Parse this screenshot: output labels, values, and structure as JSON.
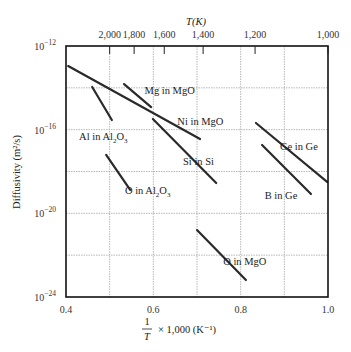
{
  "chart_data": {
    "type": "line",
    "title": "",
    "xlabel": "1/T × 1,000 (K⁻¹)",
    "ylabel": "Diffusivity (m²/s)",
    "top_xlabel": "T(K)",
    "xlim": [
      0.4,
      1.0
    ],
    "ylim_log10": [
      -24,
      -12
    ],
    "yscale": "log",
    "grid": true,
    "x_ticks": [
      0.4,
      0.6,
      0.8,
      1.0
    ],
    "x_tick_labels": [
      "0.4",
      "0.6",
      "0.8",
      "1.0"
    ],
    "x_grid": [
      0.5,
      0.6,
      0.7,
      0.8,
      0.9
    ],
    "y_ticks_log10": [
      -12,
      -16,
      -20,
      -24
    ],
    "y_tick_labels": [
      "10⁻¹²",
      "10⁻¹⁶",
      "10⁻²⁰",
      "10⁻²⁴"
    ],
    "y_grid_log10": [
      -14,
      -16,
      -18,
      -20,
      -22
    ],
    "top_ticks": [
      {
        "label": "2,000",
        "T": 2000,
        "x": 0.5
      },
      {
        "label": "1,800",
        "T": 1800,
        "x": 0.556
      },
      {
        "label": "1,600",
        "T": 1600,
        "x": 0.625
      },
      {
        "label": "1,400",
        "T": 1400,
        "x": 0.714
      },
      {
        "label": "1,200",
        "T": 1200,
        "x": 0.833
      },
      {
        "label": "1,000",
        "T": 1000,
        "x": 1.0
      }
    ],
    "series": [
      {
        "name": "Ni in MgO",
        "x": [
          0.405,
          0.707
        ],
        "log10_D": [
          -12.96,
          -16.45
        ],
        "label_pos": [
          0.655,
          -15.6
        ]
      },
      {
        "name": "Mg in MgO",
        "x": [
          0.533,
          0.595
        ],
        "log10_D": [
          -13.82,
          -14.92
        ],
        "label_pos": [
          0.58,
          -14.1
        ]
      },
      {
        "name": "Al in Al2O3",
        "x": [
          0.46,
          0.505
        ],
        "log10_D": [
          -13.96,
          -15.54
        ],
        "label_pos": [
          0.43,
          -16.3
        ]
      },
      {
        "name": "Si in Si",
        "x": [
          0.599,
          0.744
        ],
        "log10_D": [
          -15.49,
          -18.55
        ],
        "label_pos": [
          0.668,
          -17.5
        ]
      },
      {
        "name": "O in Al2O3",
        "x": [
          0.492,
          0.547
        ],
        "log10_D": [
          -17.21,
          -18.88
        ],
        "label_pos": [
          0.535,
          -18.9
        ]
      },
      {
        "name": "Ge in Ge",
        "x": [
          0.835,
          0.998
        ],
        "log10_D": [
          -15.68,
          -18.5
        ],
        "label_pos": [
          0.89,
          -16.8
        ]
      },
      {
        "name": "B in Ge",
        "x": [
          0.849,
          0.961
        ],
        "log10_D": [
          -16.73,
          -19.08
        ],
        "label_pos": [
          0.855,
          -19.1
        ]
      },
      {
        "name": "O in MgO",
        "x": [
          0.7,
          0.812
        ],
        "log10_D": [
          -20.8,
          -23.19
        ],
        "label_pos": [
          0.76,
          -22.3
        ]
      }
    ]
  },
  "labels": {
    "top_axis_title": "T(K)",
    "y_axis_title": "Diffusivity (m²/s)",
    "x_axis_fraction_num": "1",
    "x_axis_fraction_den": "T",
    "x_axis_suffix": "× 1,000 (K⁻¹)"
  }
}
